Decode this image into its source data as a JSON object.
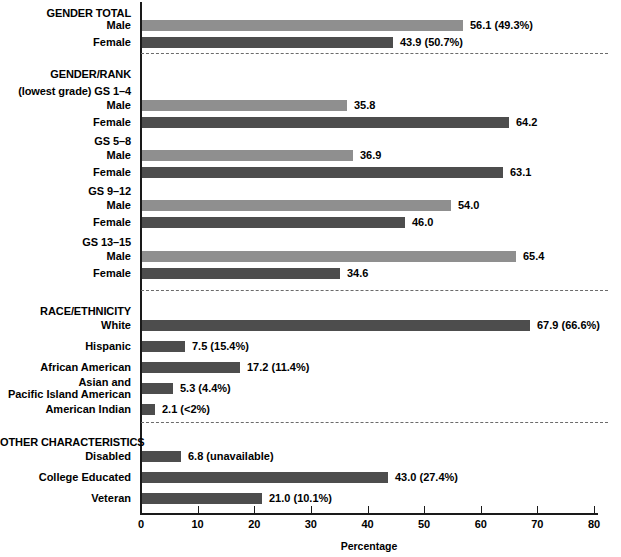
{
  "chart_data": {
    "type": "bar",
    "title": "",
    "xlabel": "Percentage",
    "ylabel": "",
    "xlim": [
      0,
      80
    ],
    "xticks": [
      0,
      10,
      20,
      30,
      40,
      50,
      60,
      70,
      80
    ],
    "grid": false,
    "legend": "none",
    "orientation": "horizontal",
    "series_colors": {
      "light": "#8f8f8f",
      "dark": "#4d4d4d"
    },
    "sections": [
      {
        "heading": "GENDER TOTAL",
        "subheading": "",
        "rows": [
          {
            "label": "Male",
            "value": 56.1,
            "shade": "light",
            "value_label": "56.1 (49.3%)"
          },
          {
            "label": "Female",
            "value": 43.9,
            "shade": "dark",
            "value_label": "43.9 (50.7%)"
          }
        ]
      },
      {
        "heading": "GENDER/RANK",
        "subheading": "(lowest grade) GS 1–4",
        "rows": [
          {
            "label": "Male",
            "value": 35.8,
            "shade": "light",
            "value_label": "35.8"
          },
          {
            "label": "Female",
            "value": 64.2,
            "shade": "dark",
            "value_label": "64.2"
          }
        ]
      },
      {
        "heading": "",
        "subheading": "GS 5–8",
        "rows": [
          {
            "label": "Male",
            "value": 36.9,
            "shade": "light",
            "value_label": "36.9"
          },
          {
            "label": "Female",
            "value": 63.1,
            "shade": "dark",
            "value_label": "63.1"
          }
        ]
      },
      {
        "heading": "",
        "subheading": "GS 9–12",
        "rows": [
          {
            "label": "Male",
            "value": 54.0,
            "shade": "light",
            "value_label": "54.0"
          },
          {
            "label": "Female",
            "value": 46.0,
            "shade": "dark",
            "value_label": "46.0"
          }
        ]
      },
      {
        "heading": "",
        "subheading": "GS 13–15",
        "rows": [
          {
            "label": "Male",
            "value": 65.4,
            "shade": "light",
            "value_label": "65.4"
          },
          {
            "label": "Female",
            "value": 34.6,
            "shade": "dark",
            "value_label": "34.6"
          }
        ]
      },
      {
        "heading": "RACE/ETHNICITY",
        "subheading": "",
        "rows": [
          {
            "label": "White",
            "value": 67.9,
            "shade": "dark",
            "value_label": "67.9 (66.6%)"
          },
          {
            "label": "Hispanic",
            "value": 7.5,
            "shade": "dark",
            "value_label": "7.5 (15.4%)"
          },
          {
            "label": "African American",
            "value": 17.2,
            "shade": "dark",
            "value_label": "17.2 (11.4%)"
          },
          {
            "label": "Asian and Pacific Island American",
            "value": 5.3,
            "shade": "dark",
            "value_label": "5.3 (4.4%)"
          },
          {
            "label": "American Indian",
            "value": 2.1,
            "shade": "dark",
            "value_label": "2.1 (<2%)"
          }
        ]
      },
      {
        "heading": "OTHER CHARACTERISTICS",
        "subheading": "",
        "rows": [
          {
            "label": "Disabled",
            "value": 6.8,
            "shade": "dark",
            "value_label": "6.8 (unavailable)"
          },
          {
            "label": "College Educated",
            "value": 43.0,
            "shade": "dark",
            "value_label": "43.0 (27.4%)"
          },
          {
            "label": "Veteran",
            "value": 21.0,
            "shade": "dark",
            "value_label": "21.0 (10.1%)"
          }
        ]
      }
    ]
  },
  "axis": {
    "x_title": "Percentage",
    "tick_labels": [
      "0",
      "10",
      "20",
      "30",
      "40",
      "50",
      "60",
      "70",
      "80"
    ]
  },
  "layout": {
    "headings": {
      "gender_total": "GENDER TOTAL",
      "gender_rank": "GENDER/RANK",
      "gs_1_4": "(lowest grade) GS 1–4",
      "gs_5_8": "GS 5–8",
      "gs_9_12": "GS 9–12",
      "gs_13_15": "GS 13–15",
      "race_ethnicity": "RACE/ETHNICITY",
      "other_characteristics": "OTHER CHARACTERISTICS"
    },
    "labels": {
      "male": "Male",
      "female": "Female",
      "white": "White",
      "hispanic": "Hispanic",
      "african_american": "African American",
      "asian_pacific_1": "Asian and",
      "asian_pacific_2": "Pacific Island American",
      "american_indian": "American Indian",
      "disabled": "Disabled",
      "college_educated": "College Educated",
      "veteran": "Veteran"
    },
    "values": {
      "male_total": "56.1 (49.3%)",
      "female_total": "43.9 (50.7%)",
      "male_gs14": "35.8",
      "female_gs14": "64.2",
      "male_gs58": "36.9",
      "female_gs58": "63.1",
      "male_gs912": "54.0",
      "female_gs912": "46.0",
      "male_gs1315": "65.4",
      "female_gs1315": "34.6",
      "white": "67.9 (66.6%)",
      "hispanic": "7.5 (15.4%)",
      "african_american": "17.2 (11.4%)",
      "asian_pacific": "5.3 (4.4%)",
      "american_indian": "2.1 (<2%)",
      "disabled": "6.8 (unavailable)",
      "college_educated": "43.0 (27.4%)",
      "veteran": "21.0 (10.1%)"
    }
  }
}
